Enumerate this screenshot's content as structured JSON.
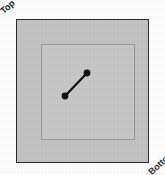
{
  "figure": {
    "title": "Top",
    "background_color": "#fefefe",
    "labels": {
      "top_left": "Top",
      "bottom_right": "Bottom"
    }
  },
  "outer_square": {
    "fill_color": "#c3c3c3",
    "border_color": "#2b2b2b",
    "name": "outer-plate"
  },
  "inner_square": {
    "fill_color": "#c8c8c8",
    "border_color": "#9a9a9a",
    "name": "inner-plate"
  },
  "segment": {
    "stroke_color": "#111111",
    "marker_color": "#111111",
    "x1": 65,
    "y1": 96,
    "x2": 87,
    "y2": 73,
    "stroke_width": 2.2,
    "marker_radius": 3.4
  },
  "chart_data": {
    "type": "scatter",
    "title": "Top",
    "xlabel": "",
    "ylabel": "",
    "xlim": [
      16,
      149
    ],
    "ylim": [
      19,
      163
    ],
    "grid": false,
    "legend": null,
    "series": [
      {
        "name": "segment",
        "x": [
          65,
          87
        ],
        "y": [
          96,
          73
        ]
      }
    ],
    "annotations": [
      "Top"
    ]
  }
}
